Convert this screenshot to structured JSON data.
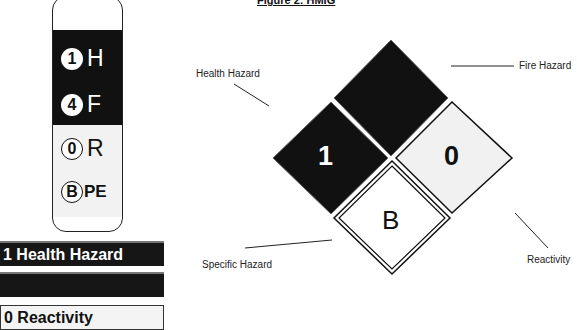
{
  "figure": {
    "title": "Figure 2: HMIG",
    "labels": {
      "health": "Health Hazard",
      "fire": "Fire Hazard",
      "specific": "Specific Hazard",
      "reactivity": "Reactivity"
    },
    "diamond": {
      "health_value": "1",
      "fire_value": "",
      "reactivity_value": "0",
      "specific_value": "B"
    }
  },
  "label_tag": {
    "rows": [
      {
        "value": "1",
        "letter": "H"
      },
      {
        "value": "4",
        "letter": "F"
      },
      {
        "value": "0",
        "letter": "R"
      },
      {
        "value": "B",
        "letter": "PE"
      }
    ]
  },
  "bars": [
    {
      "text": "1 Health Hazard",
      "style": "dark"
    },
    {
      "text": "",
      "style": "dark"
    },
    {
      "text": "0 Reactivity",
      "style": "light"
    }
  ],
  "colors": {
    "black": "#111111",
    "light_gray": "#f2f2f2",
    "white": "#ffffff"
  }
}
